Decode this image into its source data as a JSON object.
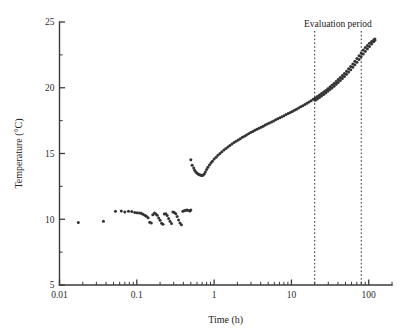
{
  "chart_data": {
    "type": "scatter",
    "title": "",
    "xlabel": "Time (h)",
    "ylabel": "Temperature (°C)",
    "xscale": "log",
    "yscale": "linear",
    "xlim": [
      0.01,
      200
    ],
    "ylim": [
      5,
      25
    ],
    "grid": false,
    "legend": null,
    "x_tick_labels": [
      "0.01",
      "0.1",
      "1",
      "10",
      "100"
    ],
    "x_tick_values": [
      0.01,
      0.1,
      1,
      10,
      100
    ],
    "y_tick_labels": [
      "5",
      "10",
      "15",
      "20",
      "25"
    ],
    "y_tick_values": [
      5,
      10,
      15,
      20,
      25
    ],
    "y_minor_tick_values": [
      7.5,
      12.5,
      17.5,
      22.5
    ],
    "annotations": [
      {
        "name": "evaluation-period-label",
        "text": "Evaluation period",
        "x": 40,
        "y": 24.6
      }
    ],
    "vertical_markers": [
      {
        "name": "evaluation-start",
        "x": 20
      },
      {
        "name": "evaluation-end",
        "x": 80
      }
    ],
    "marker_color": "#333333",
    "marker_size": 3.0,
    "series": [
      {
        "name": "Temperature sensor A",
        "color": "#333333",
        "x": [
          0.0175,
          0.037,
          0.053,
          0.063,
          0.07,
          0.078,
          0.086,
          0.094,
          0.101,
          0.108,
          0.114,
          0.12,
          0.127,
          0.133,
          0.14,
          0.147,
          0.154,
          0.161,
          0.169,
          0.176,
          0.184,
          0.192,
          0.2,
          0.209,
          0.218,
          0.227,
          0.237,
          0.247,
          0.258,
          0.269,
          0.281,
          0.293,
          0.306,
          0.319,
          0.333,
          0.347,
          0.362,
          0.378,
          0.394,
          0.411,
          0.429,
          0.447,
          0.466,
          0.486,
          0.5
        ],
        "y": [
          9.75,
          9.85,
          10.6,
          10.62,
          10.55,
          10.6,
          10.58,
          10.52,
          10.5,
          10.48,
          10.45,
          10.38,
          10.3,
          10.22,
          10.12,
          9.78,
          9.72,
          10.35,
          10.48,
          10.4,
          10.3,
          10.1,
          9.92,
          9.7,
          9.62,
          10.4,
          10.42,
          10.28,
          10.05,
          9.85,
          9.68,
          10.55,
          10.52,
          10.42,
          10.2,
          9.95,
          9.72,
          9.58,
          10.6,
          10.65,
          10.68,
          10.7,
          10.66,
          10.62,
          10.7
        ]
      },
      {
        "name": "Temperature sensor B (warming)",
        "color": "#333333",
        "note": "curve dips to minimum near 0.7 h then rises log-linearly",
        "x": [
          0.5,
          0.52,
          0.545,
          0.56,
          0.58,
          0.6,
          0.62,
          0.64,
          0.66,
          0.68,
          0.7,
          0.72,
          0.745,
          0.77,
          0.8,
          0.83,
          0.87,
          0.91,
          0.95,
          1.0,
          1.06,
          1.12,
          1.19,
          1.26,
          1.34,
          1.42,
          1.51,
          1.6,
          1.7,
          1.81,
          1.92,
          2.05,
          2.18,
          2.32,
          2.47,
          2.62,
          2.79,
          2.97,
          3.16,
          3.36,
          3.57,
          3.8,
          4.05,
          4.31,
          4.58,
          4.87,
          5.19,
          5.52,
          5.87,
          6.25,
          6.65,
          7.08,
          7.53,
          8.01,
          8.53,
          9.07,
          9.65,
          10.27,
          10.93,
          11.63,
          12.37,
          13.17,
          14.01,
          14.9,
          15.86,
          16.88,
          17.96,
          19.11,
          20.33,
          21.64,
          23.02,
          24.5,
          26.07,
          27.74,
          29.52,
          31.41,
          33.42,
          35.57,
          37.85,
          40.27,
          42.85,
          45.6,
          48.52,
          51.63,
          54.94,
          58.46,
          62.21,
          66.19,
          70.43,
          74.95,
          79.75,
          84.86,
          90.3,
          96.08,
          102.2,
          108.8,
          115.8,
          120.0
        ],
        "y": [
          14.52,
          14.1,
          13.9,
          13.72,
          13.6,
          13.52,
          13.45,
          13.4,
          13.36,
          13.34,
          13.33,
          13.36,
          13.45,
          13.6,
          13.78,
          13.95,
          14.12,
          14.28,
          14.42,
          14.58,
          14.72,
          14.86,
          15.0,
          15.13,
          15.26,
          15.38,
          15.5,
          15.61,
          15.72,
          15.83,
          15.93,
          16.03,
          16.13,
          16.23,
          16.32,
          16.41,
          16.5,
          16.59,
          16.68,
          16.76,
          16.84,
          16.92,
          17.0,
          17.08,
          17.16,
          17.24,
          17.32,
          17.4,
          17.48,
          17.56,
          17.64,
          17.72,
          17.8,
          17.88,
          17.96,
          18.04,
          18.12,
          18.2,
          18.28,
          18.37,
          18.46,
          18.55,
          18.64,
          18.73,
          18.82,
          18.92,
          19.02,
          19.12,
          19.22,
          19.33,
          19.44,
          19.56,
          19.68,
          19.8,
          19.93,
          20.06,
          20.19,
          20.33,
          20.47,
          20.62,
          20.77,
          20.93,
          21.09,
          21.26,
          21.44,
          21.62,
          21.81,
          22.01,
          22.22,
          22.43,
          22.65,
          22.88,
          23.06,
          23.22,
          23.38,
          23.52,
          23.64,
          23.7
        ]
      },
      {
        "name": "Temperature sensor C (warming, lower branch)",
        "color": "#333333",
        "note": "nearly coincident with sensor B, diverges slightly after 20 h",
        "x": [
          20.33,
          21.64,
          23.02,
          24.5,
          26.07,
          27.74,
          29.52,
          31.41,
          33.42,
          35.57,
          37.85,
          40.27,
          42.85,
          45.6,
          48.52,
          51.63,
          54.94,
          58.46,
          62.21,
          66.19,
          70.43,
          74.95,
          79.75,
          84.86,
          90.3,
          96.08,
          102.2,
          108.8,
          115.8,
          120.0
        ],
        "y": [
          19.05,
          19.15,
          19.26,
          19.37,
          19.49,
          19.61,
          19.74,
          19.86,
          19.99,
          20.12,
          20.26,
          20.4,
          20.55,
          20.7,
          20.86,
          21.02,
          21.19,
          21.37,
          21.55,
          21.74,
          21.94,
          22.14,
          22.35,
          22.57,
          22.77,
          22.96,
          23.14,
          23.32,
          23.5,
          23.62
        ]
      }
    ]
  },
  "figure": {
    "background_color": "#ffffff",
    "axis_color": "#3a3a3a",
    "text_color": "#202020"
  }
}
